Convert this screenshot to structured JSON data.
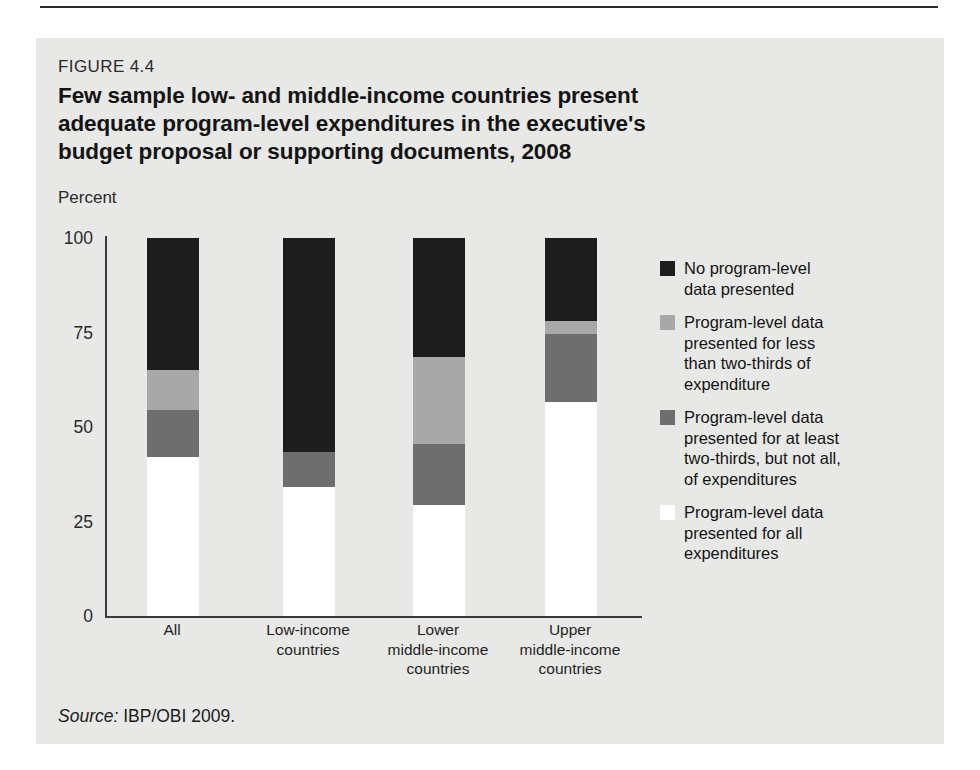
{
  "figure": {
    "number": "FIGURE 4.4",
    "title": "Few sample low- and middle-income countries present adequate program-level expenditures in the executive's budget proposal or supporting documents, 2008",
    "axis_unit": "Percent",
    "source_label": "Source:",
    "source_text": " IBP/OBI 2009."
  },
  "colors": {
    "panel_background": "#e8e8e6",
    "black": "#1d1d1d",
    "light_gray": "#a8a8a8",
    "mid_gray": "#6e6e6e",
    "white": "#ffffff",
    "axis": "#3b3b3b",
    "text": "#141414"
  },
  "legend": {
    "items": [
      {
        "color": "#1d1d1d",
        "label": "No program-level\ndata presented"
      },
      {
        "color": "#a8a8a8",
        "label": "Program-level data\npresented for less\nthan two-thirds of\nexpenditure"
      },
      {
        "color": "#6e6e6e",
        "label": "Program-level data\npresented for at least\ntwo-thirds, but not all,\nof expenditures"
      },
      {
        "color": "#ffffff",
        "label": "Program-level data\npresented for all\nexpenditures"
      }
    ]
  },
  "chart_data": {
    "type": "bar",
    "stacked": true,
    "title": "Few sample low- and middle-income countries present adequate program-level expenditures in the executive's budget proposal or supporting documents, 2008",
    "xlabel": "",
    "ylabel": "Percent",
    "ylim": [
      0,
      100
    ],
    "yticks": [
      0,
      25,
      50,
      75,
      100
    ],
    "grid": false,
    "legend_position": "right",
    "categories": [
      "All",
      "Low-income\ncountries",
      "Lower\nmiddle-income\ncountries",
      "Upper\nmiddle-income\ncountries"
    ],
    "series": [
      {
        "name": "Program-level data presented for all expenditures",
        "color": "#ffffff",
        "values": [
          42,
          34,
          29.5,
          56.5
        ]
      },
      {
        "name": "Program-level data presented for at least two-thirds, but not all, of expenditures",
        "color": "#6e6e6e",
        "values": [
          12.5,
          9.5,
          16,
          18
        ]
      },
      {
        "name": "Program-level data presented for less than two-thirds of expenditure",
        "color": "#a8a8a8",
        "values": [
          10.5,
          0,
          23,
          3.5
        ]
      },
      {
        "name": "No program-level data presented",
        "color": "#1d1d1d",
        "values": [
          35,
          56.5,
          31.5,
          22
        ]
      }
    ]
  }
}
